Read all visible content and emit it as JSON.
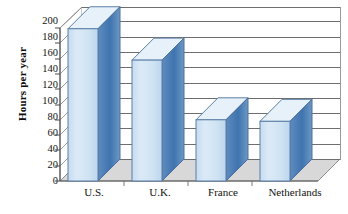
{
  "chart_data": {
    "type": "bar",
    "title": "",
    "xlabel": "",
    "ylabel": "Hours per year",
    "categories": [
      "U.S.",
      "U.K.",
      "France",
      "Netherlands"
    ],
    "values": [
      199,
      158,
      80,
      78
    ],
    "ylim": [
      0,
      200
    ],
    "yticks": [
      0,
      20,
      40,
      60,
      80,
      100,
      120,
      140,
      160,
      180,
      200
    ],
    "ytick_labels": [
      "0",
      "20",
      "40",
      "60",
      "80",
      "100",
      "120",
      "140",
      "160",
      "180",
      "200"
    ],
    "grid": true,
    "legend": false,
    "legend_position": "none",
    "style": "3d-column",
    "colors": {
      "bar_front": "#d2e4f3",
      "bar_side": "#4a7db5",
      "bar_top": "#e3eff9",
      "bar_outline": "#5c7fa8",
      "gridline": "#6e6e6e",
      "floor": "#d8d8d8",
      "background": "#ffffff",
      "text": "#111111"
    }
  },
  "axis": {
    "y_title": "Hours per year"
  }
}
